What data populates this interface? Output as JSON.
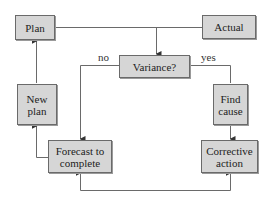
{
  "nodes": {
    "plan": "Plan",
    "actual": "Actual",
    "variance": "Variance?",
    "new_plan": "New plan",
    "find_cause": "Find cause",
    "forecast": "Forecast to complete",
    "corrective": "Corrective action"
  },
  "edge_labels": {
    "no": "no",
    "yes": "yes"
  },
  "colors": {
    "box_fill": "#d6d6d6",
    "box_border": "#6a6a6a",
    "line": "#6a6a6a"
  }
}
